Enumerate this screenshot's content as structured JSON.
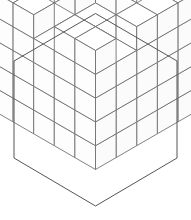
{
  "figure": {
    "kind": "rhombille-tiling",
    "canvas": {
      "width": 191,
      "height": 220
    },
    "colors": {
      "background": "#ffffff",
      "line": "#6b6b6b",
      "outline": "#555555",
      "face_top": "#ffffff",
      "face_left": "#fdfdfd",
      "face_right": "#fbfbfb"
    },
    "geometry": {
      "center_x": 95.5,
      "center_y": 110,
      "cell_width": 20.6,
      "cell_height": 11.9,
      "grid_radius": 5,
      "hexagon_vertices": [
        [
          95.5,
          13.5
        ],
        [
          177.0,
          61.0
        ],
        [
          177.0,
          158.0
        ],
        [
          95.5,
          206.0
        ],
        [
          14.0,
          158.0
        ],
        [
          14.0,
          61.0
        ]
      ]
    },
    "heightmap": {
      "note": "Height (number of stacked cubes) at each (column,row) of the 5x5 base grid, x from left-back, y from right-back",
      "size": 5,
      "values": [
        [
          5,
          5,
          4,
          5,
          5
        ],
        [
          5,
          3,
          3,
          4,
          5
        ],
        [
          4,
          3,
          2,
          3,
          5
        ],
        [
          5,
          4,
          3,
          4,
          4
        ],
        [
          5,
          5,
          4,
          5,
          5
        ]
      ]
    }
  }
}
